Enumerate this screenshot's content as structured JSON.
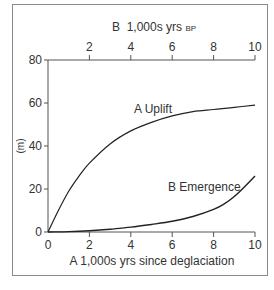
{
  "chart_data": {
    "type": "line",
    "top_axis": {
      "label_prefix": "B  1,000s yrs ",
      "label_suffix": "BP",
      "ticks": [
        "2",
        "4",
        "6",
        "8",
        "10"
      ]
    },
    "bottom_axis": {
      "label": "A  1,000s yrs since deglaciation",
      "ticks": [
        "0",
        "2",
        "4",
        "6",
        "8",
        "10"
      ]
    },
    "y_axis": {
      "label": "(m)",
      "ticks": [
        "0",
        "20",
        "40",
        "60",
        "80"
      ],
      "ylim": [
        0,
        80
      ]
    },
    "xlim": [
      0,
      10
    ],
    "series": [
      {
        "name": "A Uplift",
        "x": [
          0,
          0.5,
          1,
          1.5,
          2,
          3,
          4,
          5,
          6,
          7,
          8,
          9,
          10
        ],
        "values": [
          0,
          10,
          19,
          26,
          32,
          41,
          47,
          51,
          54,
          56,
          57,
          58,
          59
        ]
      },
      {
        "name": "B Emergence",
        "x": [
          0,
          1,
          2,
          3,
          4,
          5,
          6,
          7,
          8,
          8.5,
          9,
          9.5,
          10
        ],
        "values": [
          0,
          0.2,
          0.6,
          1.3,
          2.3,
          3.5,
          5,
          7.2,
          10.5,
          13,
          16.5,
          21,
          26
        ]
      }
    ],
    "annotations": [
      "A Uplift",
      "B Emergence"
    ]
  }
}
